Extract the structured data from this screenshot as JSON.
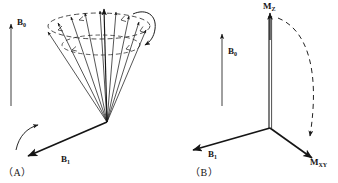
{
  "figure": {
    "type": "nmr-magnetization-vector-diagram",
    "panels": [
      {
        "id": "A",
        "caption": "（A）",
        "labels": {
          "b0": "B",
          "b0_sub": "0",
          "b1": "B",
          "b1_sub": "1"
        },
        "description": "spin vectors fanning on a precession cone about B0 tipped by B1"
      },
      {
        "id": "B",
        "caption": "（B）",
        "labels": {
          "b0": "B",
          "b0_sub": "0",
          "b1": "B",
          "b1_sub": "1",
          "mz": "M",
          "mz_sub": "Z",
          "mxy": "M",
          "mxy_sub": "XY"
        },
        "description": "coordinate axes with Mz tipping along dashed arc into Mxy"
      }
    ],
    "colors": {
      "ink": "#151515",
      "line": "#1a1a1a",
      "background": "#ffffff"
    }
  }
}
